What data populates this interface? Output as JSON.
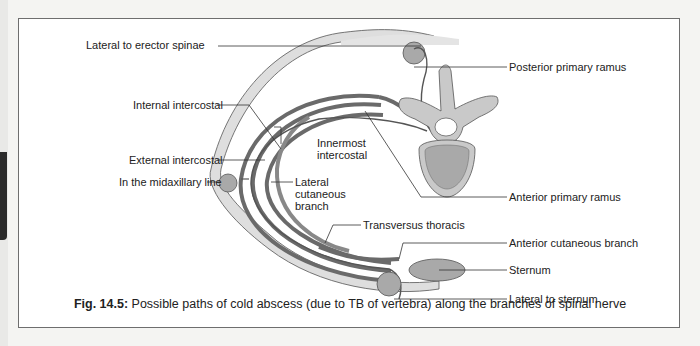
{
  "figure": {
    "labels": {
      "lateral_to_erector_spinae": "Lateral to erector spinae",
      "internal_intercostal": "Internal intercostal",
      "external_intercostal": "External intercostal",
      "in_the_midaxillary_line": "In the midaxillary line",
      "innermost_intercostal_1": "Innermost",
      "innermost_intercostal_2": "intercostal",
      "lateral_cutaneous_1": "Lateral",
      "lateral_cutaneous_2": "cutaneous",
      "lateral_cutaneous_3": "branch",
      "posterior_primary_ramus": "Posterior primary ramus",
      "anterior_primary_ramus": "Anterior primary ramus",
      "transversus_thoracis": "Transversus thoracis",
      "anterior_cutaneous_branch": "Anterior cutaneous branch",
      "sternum": "Sternum",
      "lateral_to_sternum": "Lateral to sternum"
    },
    "caption": {
      "number": "Fig. 14.5:",
      "text": "Possible paths of cold abscess (due to TB of vertebra) along the branches of spinal nerve"
    },
    "colors": {
      "muscle_dark": "#6a6a6a",
      "skin_fill": "#dcdcdc",
      "bone_fill": "#c9c9c9",
      "abscess_fill": "#a9a9a9",
      "line": "#333333"
    }
  }
}
